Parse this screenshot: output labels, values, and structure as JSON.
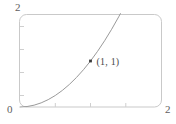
{
  "chart_data": {
    "type": "line",
    "title": "",
    "subtitle": "",
    "xlabel": "",
    "ylabel": "",
    "xlim": [
      0,
      2
    ],
    "ylim": [
      0,
      2
    ],
    "grid": false,
    "legend": null,
    "xticks": [
      0,
      0.5,
      1,
      1.5,
      2
    ],
    "yticks": [
      0,
      0.5,
      1,
      1.5,
      2
    ],
    "xtick_labels": [
      "0",
      "",
      "",
      "",
      "2"
    ],
    "ytick_labels": [
      "",
      "",
      "",
      "",
      "2"
    ],
    "series": [
      {
        "name": "curve",
        "style": "solid",
        "color": "#9a9a9a",
        "x": [
          0.0,
          0.1,
          0.2,
          0.3,
          0.4,
          0.5,
          0.6,
          0.7,
          0.8,
          0.9,
          1.0,
          1.1,
          1.2,
          1.3,
          1.4,
          1.5
        ],
        "y": [
          0.0,
          0.01,
          0.04,
          0.09,
          0.16,
          0.25,
          0.36,
          0.49,
          0.64,
          0.81,
          1.0,
          1.21,
          1.44,
          1.69,
          1.96,
          2.25
        ]
      }
    ],
    "points": [
      {
        "name": "marked-point",
        "x": 1,
        "y": 1,
        "label": "(1, 1)",
        "marker": "square",
        "color": "#3a3a3a"
      }
    ],
    "annotations": [
      {
        "name": "y-axis-max",
        "text": "2"
      },
      {
        "name": "origin",
        "text": "0"
      },
      {
        "name": "x-axis-max",
        "text": "2"
      }
    ]
  },
  "axis_labels": {
    "y_max": "2",
    "origin": "0",
    "x_max": "2"
  },
  "point_label": {
    "text": "(1, 1)"
  },
  "colors": {
    "frame": "#c9c9c9",
    "curve": "#9a9a9a",
    "tick": "#cfcfcf",
    "text": "#5e5e5e",
    "marker": "#3a3a3a",
    "background": "#ffffff"
  }
}
